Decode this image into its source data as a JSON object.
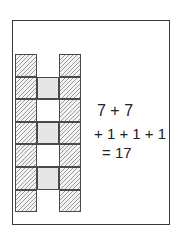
{
  "figure": {
    "frame": {
      "stroke": "#3a3a3a"
    },
    "grid": {
      "rows": 7,
      "columns": 3,
      "cell_size_px": 22,
      "left_column": [
        "hatched",
        "hatched",
        "hatched",
        "hatched",
        "hatched",
        "hatched",
        "hatched"
      ],
      "middle_column": [
        "empty",
        "stippled",
        "white",
        "stippled",
        "white",
        "stippled",
        "empty"
      ],
      "right_column": [
        "hatched",
        "hatched",
        "hatched",
        "hatched",
        "hatched",
        "hatched",
        "hatched"
      ],
      "hatched_count": 14,
      "stippled_count": 3
    },
    "equation": {
      "line1": "7 + 7",
      "line2": "+ 1 + 1 + 1",
      "line3": "= 17"
    }
  }
}
